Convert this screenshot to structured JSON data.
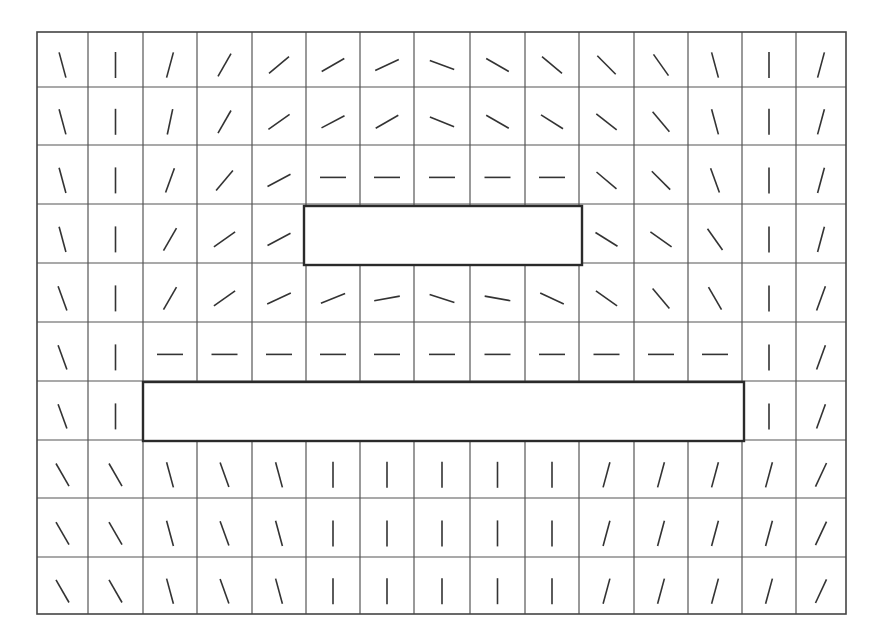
{
  "diagram": {
    "title": "",
    "type": "orientation-field-grid",
    "colors": {
      "background": "#ffffff",
      "grid": "#555555",
      "segment": "#333333",
      "obstacle_border": "#2a2a2a"
    },
    "grid": {
      "columns": 15,
      "rows": 10,
      "x_lines": [
        37,
        88,
        143,
        197,
        252,
        306,
        360,
        414,
        470,
        525,
        579,
        634,
        688,
        742,
        796,
        846
      ],
      "y_lines": [
        32,
        87,
        145,
        204,
        263,
        322,
        381,
        440,
        498,
        557,
        614
      ]
    },
    "segment_length": 26,
    "segment_angle_convention": "degrees from vertical; positive leans right (/), negative leans left (\\), 90 = horizontal; null = covered by obstacle",
    "angles": [
      [
        -15,
        0,
        15,
        30,
        50,
        60,
        65,
        -70,
        -60,
        -50,
        -45,
        -35,
        -15,
        0,
        15
      ],
      [
        -15,
        0,
        12,
        30,
        55,
        62,
        60,
        -68,
        -60,
        -58,
        -52,
        -40,
        -15,
        0,
        15
      ],
      [
        -15,
        0,
        20,
        40,
        62,
        90,
        90,
        90,
        90,
        90,
        -50,
        -45,
        -20,
        0,
        15
      ],
      [
        -15,
        0,
        30,
        55,
        62,
        null,
        null,
        null,
        null,
        null,
        -58,
        -55,
        -35,
        0,
        15
      ],
      [
        -20,
        0,
        30,
        55,
        65,
        68,
        80,
        -72,
        -80,
        -65,
        -55,
        -40,
        -30,
        0,
        20
      ],
      [
        -20,
        0,
        90,
        90,
        90,
        90,
        90,
        90,
        90,
        90,
        90,
        90,
        90,
        0,
        20
      ],
      [
        -20,
        0,
        null,
        null,
        null,
        null,
        null,
        null,
        null,
        null,
        null,
        null,
        null,
        0,
        20
      ],
      [
        -30,
        -30,
        -15,
        -20,
        -15,
        0,
        0,
        0,
        0,
        0,
        15,
        15,
        15,
        15,
        25
      ],
      [
        -30,
        -30,
        -15,
        -20,
        -15,
        0,
        0,
        0,
        0,
        0,
        15,
        15,
        15,
        15,
        25
      ],
      [
        -30,
        -30,
        -15,
        -20,
        -15,
        0,
        0,
        0,
        0,
        0,
        15,
        15,
        15,
        15,
        25
      ]
    ],
    "obstacles": [
      {
        "name": "upper-obstacle",
        "x": 304,
        "y": 206,
        "width": 278,
        "height": 59
      },
      {
        "name": "lower-obstacle",
        "x": 143,
        "y": 382,
        "width": 601,
        "height": 59
      }
    ]
  }
}
